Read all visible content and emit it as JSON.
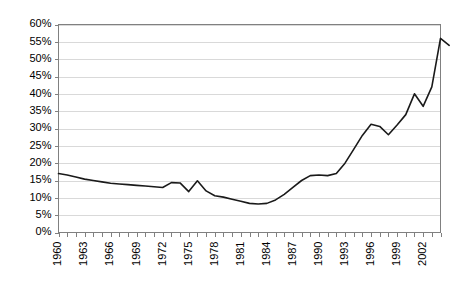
{
  "chart_data": {
    "type": "line",
    "title": "",
    "subtitle": "",
    "xlabel": "",
    "ylabel": "",
    "grid": true,
    "legend_position": "none",
    "ylim": [
      0,
      60
    ],
    "ytick_labels": [
      "0%",
      "5%",
      "10%",
      "15%",
      "20%",
      "25%",
      "30%",
      "35%",
      "40%",
      "45%",
      "50%",
      "55%",
      "60%"
    ],
    "ytick_values": [
      0,
      5,
      10,
      15,
      20,
      25,
      30,
      35,
      40,
      45,
      50,
      55,
      60
    ],
    "xlim": [
      1960,
      2004
    ],
    "xtick_labels": [
      "1960",
      "1963",
      "1966",
      "1969",
      "1972",
      "1975",
      "1978",
      "1981",
      "1984",
      "1987",
      "1990",
      "1993",
      "1996",
      "1999",
      "2002"
    ],
    "xtick_values": [
      1960,
      1963,
      1966,
      1969,
      1972,
      1975,
      1978,
      1981,
      1984,
      1987,
      1990,
      1993,
      1996,
      1999,
      2002
    ],
    "xtick_label_rotation": -90,
    "series": [
      {
        "name": "value",
        "color": "#1a1a1a",
        "x": [
          1960,
          1961,
          1962,
          1963,
          1964,
          1965,
          1966,
          1967,
          1968,
          1969,
          1970,
          1971,
          1972,
          1973,
          1974,
          1975,
          1976,
          1977,
          1978,
          1979,
          1980,
          1981,
          1982,
          1983,
          1984,
          1985,
          1986,
          1987,
          1988,
          1989,
          1990,
          1991,
          1992,
          1993,
          1994,
          1995,
          1996,
          1997,
          1998,
          1999,
          2000,
          2001,
          2002,
          2003
        ],
        "values": [
          17.0,
          16.6,
          16.0,
          15.4,
          15.0,
          14.6,
          14.2,
          14.0,
          13.8,
          13.6,
          13.4,
          13.2,
          13.0,
          14.4,
          14.3,
          11.8,
          14.9,
          12.0,
          10.6,
          10.2,
          9.6,
          9.0,
          8.4,
          8.2,
          8.4,
          9.4,
          11.0,
          13.0,
          15.0,
          16.4,
          16.6,
          16.4,
          17.0,
          20.0,
          24.0,
          28.0,
          31.2,
          30.6,
          28.2,
          31.0,
          34.0,
          40.0,
          36.4,
          42.0
        ]
      }
    ]
  },
  "series_extension": {
    "x": [
      2004,
      2005
    ],
    "values": [
      56.0,
      54.0
    ]
  }
}
